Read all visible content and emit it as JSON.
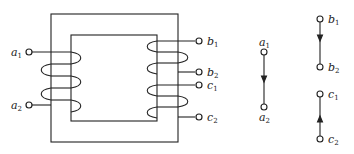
{
  "diagram": {
    "type": "transformer-windings",
    "core": {
      "outer": [
        51,
        14,
        178,
        142
      ],
      "inner": [
        71,
        35,
        157,
        121
      ]
    },
    "terminals": {
      "a1": {
        "base": "a",
        "sub": "1"
      },
      "a2": {
        "base": "a",
        "sub": "2"
      },
      "b1": {
        "base": "b",
        "sub": "1"
      },
      "b2": {
        "base": "b",
        "sub": "2"
      },
      "c1": {
        "base": "c",
        "sub": "1"
      },
      "c2": {
        "base": "c",
        "sub": "2"
      }
    },
    "equivalents": [
      {
        "from": "a1",
        "to": "a2",
        "arrow": "down"
      },
      {
        "from": "b1",
        "to": "b2",
        "arrow": "down"
      },
      {
        "from": "c2",
        "to": "c1",
        "arrow": "up"
      }
    ]
  }
}
